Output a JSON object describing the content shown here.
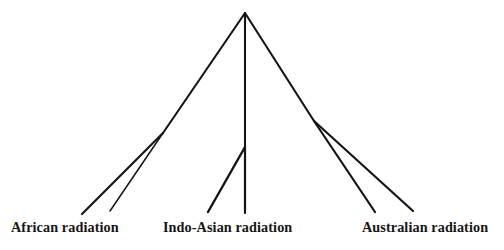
{
  "figure": {
    "type": "phylogenetic-cladogram",
    "background_color": "#ffffff",
    "line_color": "#141414",
    "text_color": "#151515",
    "width": 504,
    "height": 250
  },
  "labels": {
    "african": "African radiation",
    "indo_asian": "Indo-Asian radiation",
    "australian": "Australian radiation"
  },
  "chart_data": {
    "type": "tree",
    "title": "",
    "xlabel": "",
    "ylabel": "",
    "root": {
      "x": 245,
      "y": 13
    },
    "clades": [
      {
        "name": "African radiation",
        "node": {
          "x": 163,
          "y": 133
        },
        "tips": [
          {
            "x": 82,
            "y": 214
          },
          {
            "x": 110,
            "y": 211
          }
        ]
      },
      {
        "name": "Indo-Asian radiation",
        "node": {
          "x": 245,
          "y": 147
        },
        "tips": [
          {
            "x": 208,
            "y": 212
          },
          {
            "x": 245,
            "y": 213
          }
        ]
      },
      {
        "name": "Australian radiation",
        "node": {
          "x": 314,
          "y": 121
        },
        "tips": [
          {
            "x": 375,
            "y": 212
          },
          {
            "x": 413,
            "y": 211
          }
        ]
      }
    ],
    "edges": [
      {
        "from": "root",
        "to": "african-node",
        "x1": 245,
        "y1": 13,
        "x2": 163,
        "y2": 133
      },
      {
        "from": "african-node",
        "to": "african-tip-1",
        "x1": 163,
        "y1": 133,
        "x2": 82,
        "y2": 214
      },
      {
        "from": "african-node",
        "to": "african-tip-2",
        "x1": 163,
        "y1": 133,
        "x2": 110,
        "y2": 211
      },
      {
        "from": "root",
        "to": "indoasian-node",
        "x1": 245,
        "y1": 13,
        "x2": 245,
        "y2": 147
      },
      {
        "from": "indoasian-node",
        "to": "indoasian-tip-1",
        "x1": 245,
        "y1": 147,
        "x2": 208,
        "y2": 212
      },
      {
        "from": "indoasian-node",
        "to": "indoasian-tip-2",
        "x1": 245,
        "y1": 147,
        "x2": 245,
        "y2": 213
      },
      {
        "from": "root",
        "to": "australian-node",
        "x1": 245,
        "y1": 13,
        "x2": 314,
        "y2": 121
      },
      {
        "from": "australian-node",
        "to": "australian-tip-1",
        "x1": 314,
        "y1": 121,
        "x2": 375,
        "y2": 212
      },
      {
        "from": "australian-node",
        "to": "australian-tip-2",
        "x1": 314,
        "y1": 121,
        "x2": 413,
        "y2": 211
      }
    ],
    "legend": [],
    "grid": false
  }
}
